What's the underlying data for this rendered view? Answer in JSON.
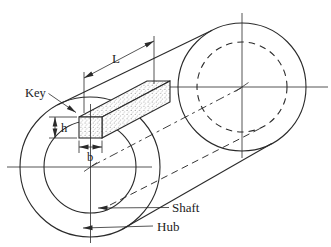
{
  "diagram": {
    "labels": {
      "key": "Key",
      "length_dim": "L",
      "height_dim": "h",
      "width_dim": "b",
      "shaft": "Shaft",
      "hub": "Hub"
    },
    "colors": {
      "line": "#2a2a2a",
      "background": "#ffffff",
      "stipple_dot": "#4a4a4a"
    }
  }
}
